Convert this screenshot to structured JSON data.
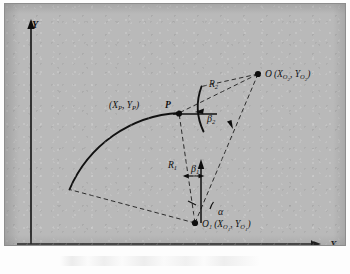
{
  "figure": {
    "background_color": "#b9b9b9",
    "ink_color": "#111111",
    "axes": {
      "x_label": "X",
      "y_label": "Y"
    },
    "points": [
      {
        "id": "P",
        "marker_label": "P",
        "coord_label": "(X",
        "coord_sub_1": "P",
        "coord_mid": ", Y",
        "coord_sub_2": "P",
        "coord_end": ")",
        "full_label": "(XP, YP) P"
      },
      {
        "id": "O",
        "marker_label": "O",
        "coord_open": "(X",
        "coord_sub_1": "O",
        "coord_subsub_1": "2",
        "coord_mid": ", Y",
        "coord_sub_2": "O",
        "coord_subsub_2": "2",
        "coord_end": ")",
        "full_label": "O (XO2, YO2)"
      },
      {
        "id": "O1",
        "marker_label": "O",
        "marker_sub": "1",
        "coord_open": "(X",
        "coord_sub_1": "O",
        "coord_subsub_1": "1",
        "coord_mid": ", Y",
        "coord_sub_2": "O",
        "coord_subsub_2": "1",
        "coord_end": ")",
        "full_label": "O1 (XO1, YO1)"
      }
    ],
    "radii": [
      {
        "id": "R1",
        "base": "R",
        "sub": "1",
        "full_label": "R1"
      },
      {
        "id": "R2",
        "base": "R",
        "sub": "2",
        "full_label": "R2"
      }
    ],
    "angles": [
      {
        "id": "beta1",
        "base": "β",
        "sub": "1",
        "full_label": "β1"
      },
      {
        "id": "beta2",
        "base": "β",
        "sub": "2",
        "full_label": "β2"
      },
      {
        "id": "alpha",
        "base": "α",
        "sub": "",
        "full_label": "α"
      }
    ]
  }
}
